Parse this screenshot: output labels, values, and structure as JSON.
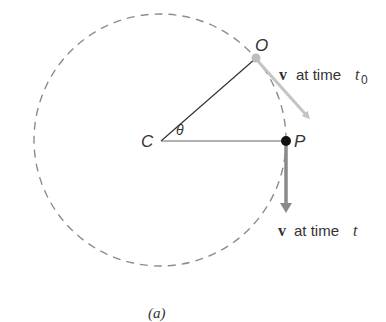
{
  "figure": {
    "caption": "(a)",
    "center_label": "C",
    "angle_label": "θ",
    "point_o_label": "O",
    "point_p_label": "P",
    "velocity_symbol": "v⃗",
    "velocity_t0_text": "at time",
    "velocity_t0_time": "t",
    "velocity_t0_subscript": "0",
    "velocity_t_text": "at time",
    "velocity_t_time": "t"
  },
  "colors": {
    "circle": "#8c8c8c",
    "radius_line": "#333333",
    "arrow_t0": "#c4c4c4",
    "arrow_t": "#8a8a8a",
    "point_o": "#bdbdbd",
    "point_p": "#111111"
  }
}
